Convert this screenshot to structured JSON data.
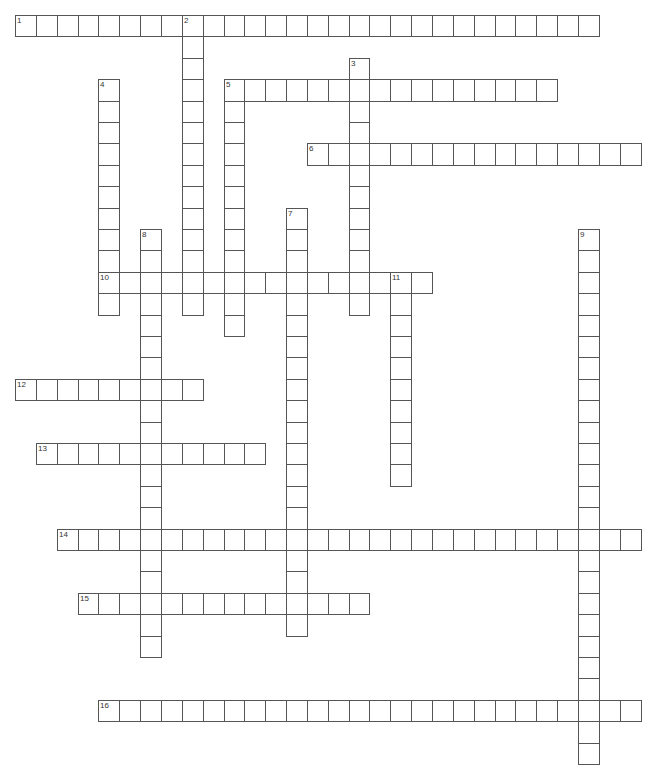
{
  "puzzle": {
    "grid": {
      "origin_x": 15,
      "origin_y": 15,
      "cell_w": 20.85,
      "cell_h": 21.4
    },
    "colors": {
      "line": "#555555",
      "cell_bg": "#ffffff",
      "number": "#333333"
    },
    "words": [
      {
        "number": "1",
        "direction": "across",
        "row": 0,
        "col": 0,
        "length": 28
      },
      {
        "number": "2",
        "direction": "down",
        "row": 0,
        "col": 8,
        "length": 14
      },
      {
        "number": "3",
        "direction": "down",
        "row": 2,
        "col": 16,
        "length": 12
      },
      {
        "number": "4",
        "direction": "down",
        "row": 3,
        "col": 4,
        "length": 11
      },
      {
        "number": "5",
        "direction": "across",
        "row": 3,
        "col": 10,
        "length": 16
      },
      {
        "number": "5",
        "direction": "down",
        "row": 3,
        "col": 10,
        "length": 12
      },
      {
        "number": "6",
        "direction": "across",
        "row": 6,
        "col": 14,
        "length": 16
      },
      {
        "number": "7",
        "direction": "down",
        "row": 9,
        "col": 13,
        "length": 20
      },
      {
        "number": "8",
        "direction": "down",
        "row": 10,
        "col": 6,
        "length": 20
      },
      {
        "number": "9",
        "direction": "down",
        "row": 10,
        "col": 27,
        "length": 25
      },
      {
        "number": "10",
        "direction": "across",
        "row": 12,
        "col": 4,
        "length": 16
      },
      {
        "number": "11",
        "direction": "down",
        "row": 12,
        "col": 18,
        "length": 10
      },
      {
        "number": "12",
        "direction": "across",
        "row": 17,
        "col": 0,
        "length": 9
      },
      {
        "number": "13",
        "direction": "across",
        "row": 20,
        "col": 1,
        "length": 11
      },
      {
        "number": "14",
        "direction": "across",
        "row": 24,
        "col": 2,
        "length": 28
      },
      {
        "number": "15",
        "direction": "across",
        "row": 27,
        "col": 3,
        "length": 14
      },
      {
        "number": "16",
        "direction": "across",
        "row": 32,
        "col": 4,
        "length": 26
      }
    ]
  }
}
